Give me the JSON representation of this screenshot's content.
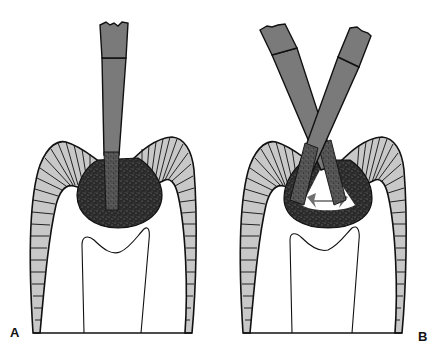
{
  "figure": {
    "panels": [
      {
        "label": "A",
        "description": "Single bur entering carious lesion from occlusal surface of molar",
        "bur_count": 1
      },
      {
        "label": "B",
        "description": "Two burs angled from opposite sides to undermine enamel; arrows indicate lateral extension",
        "bur_count": 2,
        "annotation": "bidirectional-arrow"
      }
    ],
    "colors": {
      "background": "#ffffff",
      "outline": "#111111",
      "enamel_fill": "#c8c8c8",
      "bur_fill": "#7a7a7a",
      "caries_fill": "#2a2a2a",
      "caries_speckle": "#777777",
      "arrow": "#6e6e6e"
    }
  }
}
